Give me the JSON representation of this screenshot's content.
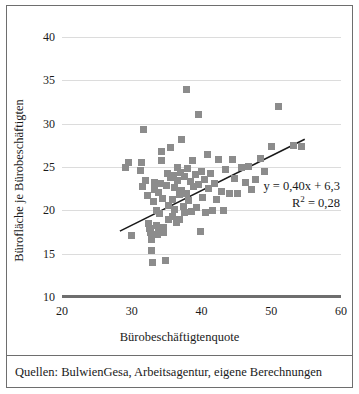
{
  "chart_data": {
    "type": "scatter",
    "title": "",
    "xlabel": "Bürobeschäftigtenquote",
    "ylabel": "Bürofläche je Bürobeschäftigten",
    "xlim": [
      20,
      60
    ],
    "ylim": [
      10,
      40
    ],
    "xticks": [
      20,
      30,
      40,
      50,
      60
    ],
    "yticks": [
      10,
      15,
      20,
      25,
      30,
      35,
      40
    ],
    "grid": true,
    "legend": false,
    "marker_color": "#8c8c8c",
    "trendline_color": "#1a1a1a",
    "gridline_color": "#dcdcdc",
    "axis_color": "#6e6e6e",
    "annotations": {
      "equation": "y = 0,40x + 6,3",
      "r_squared_prefix": "R",
      "r_squared_exponent": "2",
      "r_squared_value": " = 0,28"
    },
    "trendline": {
      "slope": 0.4,
      "intercept": 6.3,
      "x_start": 28.3,
      "x_end": 54.8,
      "y_start": 17.6,
      "y_end": 28.2
    },
    "series": [
      {
        "name": "Städte",
        "points": [
          [
            29.1,
            25.0
          ],
          [
            29.6,
            25.5
          ],
          [
            29.9,
            17.1
          ],
          [
            31.2,
            24.6
          ],
          [
            31.4,
            25.5
          ],
          [
            31.7,
            29.3
          ],
          [
            31.5,
            22.7
          ],
          [
            32.0,
            23.5
          ],
          [
            32.3,
            21.7
          ],
          [
            32.4,
            18.5
          ],
          [
            32.5,
            17.9
          ],
          [
            32.7,
            17.4
          ],
          [
            32.8,
            16.6
          ],
          [
            32.9,
            15.4
          ],
          [
            33.0,
            14.0
          ],
          [
            33.1,
            21.0
          ],
          [
            33.2,
            22.4
          ],
          [
            33.3,
            23.2
          ],
          [
            33.5,
            20.0
          ],
          [
            33.6,
            18.3
          ],
          [
            33.7,
            17.2
          ],
          [
            33.8,
            17.7
          ],
          [
            33.9,
            22.1
          ],
          [
            34.0,
            19.6
          ],
          [
            34.1,
            23.1
          ],
          [
            34.2,
            26.8
          ],
          [
            34.3,
            25.7
          ],
          [
            34.4,
            21.4
          ],
          [
            34.5,
            18.0
          ],
          [
            34.6,
            17.5
          ],
          [
            34.8,
            14.2
          ],
          [
            35.0,
            22.9
          ],
          [
            35.1,
            24.2
          ],
          [
            35.2,
            20.6
          ],
          [
            35.3,
            18.9
          ],
          [
            35.5,
            23.8
          ],
          [
            35.6,
            27.3
          ],
          [
            35.8,
            21.2
          ],
          [
            35.9,
            19.3
          ],
          [
            36.0,
            24.0
          ],
          [
            36.1,
            22.6
          ],
          [
            36.2,
            20.1
          ],
          [
            36.4,
            18.6
          ],
          [
            36.5,
            23.4
          ],
          [
            36.6,
            25.0
          ],
          [
            36.8,
            21.8
          ],
          [
            36.9,
            19.0
          ],
          [
            37.0,
            24.4
          ],
          [
            37.1,
            28.2
          ],
          [
            37.2,
            22.3
          ],
          [
            37.4,
            20.4
          ],
          [
            37.5,
            23.9
          ],
          [
            37.6,
            19.7
          ],
          [
            37.8,
            34.0
          ],
          [
            37.9,
            22.0
          ],
          [
            38.0,
            24.8
          ],
          [
            38.2,
            21.1
          ],
          [
            38.4,
            23.3
          ],
          [
            38.5,
            19.9
          ],
          [
            38.7,
            25.8
          ],
          [
            38.9,
            22.8
          ],
          [
            39.1,
            24.1
          ],
          [
            39.3,
            20.3
          ],
          [
            39.5,
            31.1
          ],
          [
            39.6,
            23.0
          ],
          [
            39.8,
            17.6
          ],
          [
            40.0,
            24.5
          ],
          [
            40.2,
            21.5
          ],
          [
            40.4,
            23.6
          ],
          [
            40.6,
            19.8
          ],
          [
            40.8,
            26.5
          ],
          [
            41.0,
            22.5
          ],
          [
            41.3,
            24.3
          ],
          [
            41.6,
            20.0
          ],
          [
            41.9,
            23.1
          ],
          [
            42.2,
            21.3
          ],
          [
            42.5,
            25.9
          ],
          [
            42.8,
            22.2
          ],
          [
            43.1,
            20.0
          ],
          [
            43.5,
            24.7
          ],
          [
            44.0,
            21.9
          ],
          [
            44.4,
            25.9
          ],
          [
            44.8,
            23.7
          ],
          [
            45.2,
            22.0
          ],
          [
            45.8,
            24.9
          ],
          [
            46.3,
            23.2
          ],
          [
            46.8,
            25.1
          ],
          [
            47.2,
            22.4
          ],
          [
            47.8,
            23.6
          ],
          [
            48.4,
            26.0
          ],
          [
            49.0,
            24.5
          ],
          [
            50.1,
            27.4
          ],
          [
            51.0,
            32.0
          ],
          [
            53.2,
            27.5
          ],
          [
            54.3,
            27.4
          ]
        ]
      }
    ]
  },
  "footer": {
    "source_note": "Quellen: BulwienGesa, Arbeitsagentur, eigene Berechnungen"
  }
}
